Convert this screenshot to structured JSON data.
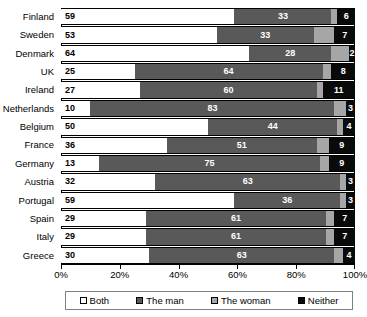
{
  "chart_data": {
    "type": "bar",
    "orientation": "horizontal",
    "stacked": true,
    "normalized_percent": true,
    "title": "",
    "subtitle": "",
    "xlabel": "",
    "ylabel": "",
    "xlim": [
      0,
      100
    ],
    "xticks": [
      0,
      20,
      40,
      60,
      80,
      100
    ],
    "xticklabels": [
      "0%",
      "20%",
      "40%",
      "60%",
      "80%",
      "100%"
    ],
    "grid": false,
    "legend_position": "bottom",
    "categories": [
      "Finland",
      "Sweden",
      "Denmark",
      "UK",
      "Ireland",
      "Netherlands",
      "Belgium",
      "France",
      "Germany",
      "Austria",
      "Portugal",
      "Spain",
      "Italy",
      "Greece"
    ],
    "series": [
      {
        "name": "Both",
        "color": "#ffffff",
        "values": [
          59,
          53,
          64,
          25,
          27,
          10,
          50,
          36,
          13,
          32,
          59,
          29,
          29,
          30
        ]
      },
      {
        "name": "The man",
        "color": "#595959",
        "values": [
          33,
          33,
          28,
          64,
          60,
          83,
          44,
          51,
          75,
          63,
          36,
          61,
          61,
          63
        ]
      },
      {
        "name": "The woman",
        "color": "#a6a6a6",
        "values": [
          2,
          7,
          6,
          3,
          2,
          4,
          2,
          4,
          3,
          2,
          2,
          3,
          3,
          3
        ]
      },
      {
        "name": "Neither",
        "color": "#0a0a0a",
        "values": [
          6,
          7,
          2,
          8,
          11,
          3,
          4,
          9,
          9,
          3,
          3,
          7,
          7,
          4
        ]
      }
    ],
    "data_labels": {
      "shown_for": [
        "Both",
        "The man",
        "Neither"
      ],
      "hidden_for": [
        "The woman"
      ]
    },
    "rows": [
      {
        "category": "Finland",
        "Both": 59,
        "The man": 33,
        "The woman": 2,
        "Neither": 6
      },
      {
        "category": "Sweden",
        "Both": 53,
        "The man": 33,
        "The woman": 7,
        "Neither": 7
      },
      {
        "category": "Denmark",
        "Both": 64,
        "The man": 28,
        "The woman": 6,
        "Neither": 2
      },
      {
        "category": "UK",
        "Both": 25,
        "The man": 64,
        "The woman": 3,
        "Neither": 8
      },
      {
        "category": "Ireland",
        "Both": 27,
        "The man": 60,
        "The woman": 2,
        "Neither": 11
      },
      {
        "category": "Netherlands",
        "Both": 10,
        "The man": 83,
        "The woman": 4,
        "Neither": 3
      },
      {
        "category": "Belgium",
        "Both": 50,
        "The man": 44,
        "The woman": 2,
        "Neither": 4
      },
      {
        "category": "France",
        "Both": 36,
        "The man": 51,
        "The woman": 4,
        "Neither": 9
      },
      {
        "category": "Germany",
        "Both": 13,
        "The man": 75,
        "The woman": 3,
        "Neither": 9
      },
      {
        "category": "Austria",
        "Both": 32,
        "The man": 63,
        "The woman": 2,
        "Neither": 3
      },
      {
        "category": "Portugal",
        "Both": 59,
        "The man": 36,
        "The woman": 2,
        "Neither": 3
      },
      {
        "category": "Spain",
        "Both": 29,
        "The man": 61,
        "The woman": 3,
        "Neither": 7
      },
      {
        "category": "Italy",
        "Both": 29,
        "The man": 61,
        "The woman": 3,
        "Neither": 7
      },
      {
        "category": "Greece",
        "Both": 30,
        "The man": 63,
        "The woman": 3,
        "Neither": 4
      }
    ]
  },
  "colors": {
    "both": "#ffffff",
    "man": "#595959",
    "woman": "#a6a6a6",
    "neither": "#0a0a0a",
    "axis": "#000000",
    "background": "#ffffff"
  }
}
